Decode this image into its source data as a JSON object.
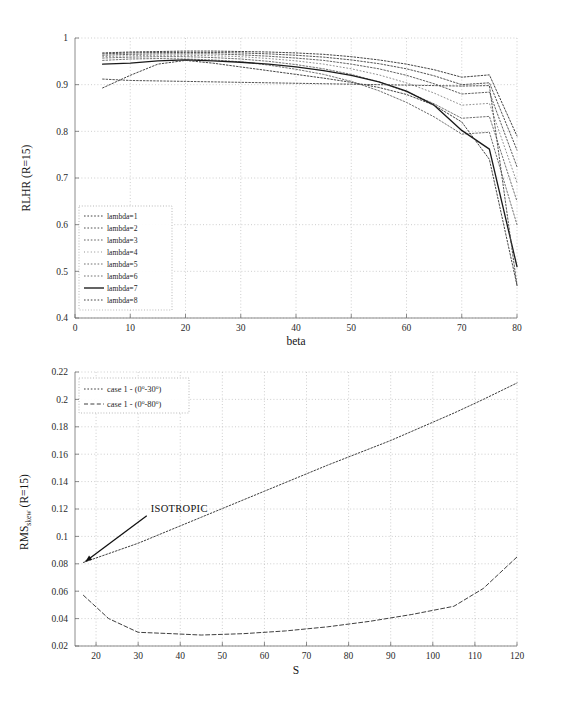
{
  "figure": {
    "title": "",
    "background": "#ffffff"
  },
  "chart_data": [
    {
      "id": "top",
      "type": "line",
      "title": "",
      "xlabel": "beta",
      "ylabel": "RLHR (R=15)",
      "xlim": [
        0,
        80
      ],
      "ylim": [
        0.4,
        1
      ],
      "xticks": [
        0,
        10,
        20,
        30,
        40,
        50,
        60,
        70,
        80
      ],
      "yticks": [
        0.4,
        0.5,
        0.6,
        0.7,
        0.8,
        0.9,
        1
      ],
      "grid": "dotted",
      "legend_position": "lower-left",
      "x": [
        5,
        10,
        15,
        20,
        25,
        30,
        35,
        40,
        45,
        50,
        55,
        60,
        65,
        70,
        75,
        80
      ],
      "series": [
        {
          "name": "lambda=1",
          "style": "dotted",
          "color": "#3a3a3a",
          "values": [
            0.968,
            0.97,
            0.971,
            0.972,
            0.972,
            0.971,
            0.97,
            0.968,
            0.965,
            0.96,
            0.953,
            0.944,
            0.932,
            0.916,
            0.921,
            0.79
          ]
        },
        {
          "name": "lambda=2",
          "style": "dotted",
          "color": "#4a4a4a",
          "values": [
            0.966,
            0.968,
            0.969,
            0.969,
            0.969,
            0.968,
            0.966,
            0.963,
            0.959,
            0.953,
            0.945,
            0.934,
            0.919,
            0.9,
            0.904,
            0.76
          ]
        },
        {
          "name": "lambda=3",
          "style": "dotted",
          "color": "#5a5a5a",
          "values": [
            0.963,
            0.965,
            0.966,
            0.966,
            0.966,
            0.964,
            0.961,
            0.957,
            0.952,
            0.944,
            0.934,
            0.92,
            0.902,
            0.88,
            0.884,
            0.724
          ]
        },
        {
          "name": "lambda=4",
          "style": "dotted-light",
          "color": "#8a8a8a",
          "values": [
            0.96,
            0.962,
            0.963,
            0.963,
            0.962,
            0.96,
            0.956,
            0.951,
            0.944,
            0.934,
            0.921,
            0.904,
            0.882,
            0.856,
            0.86,
            0.69
          ]
        },
        {
          "name": "lambda=5",
          "style": "dotted",
          "color": "#6a6a6a",
          "values": [
            0.957,
            0.959,
            0.96,
            0.96,
            0.958,
            0.955,
            0.95,
            0.943,
            0.934,
            0.922,
            0.906,
            0.885,
            0.859,
            0.828,
            0.832,
            0.65
          ]
        },
        {
          "name": "lambda=6",
          "style": "dotted",
          "color": "#6a6a6a",
          "values": [
            0.952,
            0.955,
            0.956,
            0.955,
            0.953,
            0.949,
            0.942,
            0.933,
            0.922,
            0.907,
            0.887,
            0.862,
            0.831,
            0.794,
            0.798,
            0.6
          ]
        },
        {
          "name": "lambda=7",
          "style": "solid",
          "color": "#1a1a1a",
          "values": [
            0.944,
            0.946,
            0.951,
            0.953,
            0.951,
            0.948,
            0.944,
            0.938,
            0.93,
            0.92,
            0.906,
            0.886,
            0.856,
            0.802,
            0.762,
            0.51
          ]
        },
        {
          "name": "lambda=8",
          "style": "dotted",
          "color": "#3a3a3a",
          "values": [
            0.893,
            0.92,
            0.944,
            0.952,
            0.946,
            0.938,
            0.93,
            0.922,
            0.914,
            0.905,
            0.894,
            0.879,
            0.856,
            0.82,
            0.74,
            0.47
          ]
        },
        {
          "name": "lower-branch",
          "style": "dotted",
          "color": "#4a4a4a",
          "hidden_from_legend": true,
          "values": [
            0.912,
            0.909,
            0.908,
            0.907,
            0.906,
            0.905,
            0.904,
            0.903,
            0.902,
            0.901,
            0.9,
            0.899,
            0.898,
            0.897,
            0.898,
            0.47
          ]
        }
      ]
    },
    {
      "id": "bottom",
      "type": "line",
      "title": "",
      "xlabel": "S",
      "ylabel": "RMS_skew (R=15)",
      "ylabel_main": "RMS",
      "ylabel_sub": "skew",
      "ylabel_tail": " (R=15)",
      "xlim": [
        15,
        120
      ],
      "ylim": [
        0.02,
        0.22
      ],
      "xticks": [
        20,
        30,
        40,
        50,
        60,
        70,
        80,
        90,
        100,
        110,
        120
      ],
      "yticks": [
        0.02,
        0.04,
        0.06,
        0.08,
        0.1,
        0.12,
        0.14,
        0.16,
        0.18,
        0.2,
        0.22
      ],
      "ytick_labels": [
        "0.02",
        "0.04",
        "0.06",
        "0.08",
        "0.1",
        "0.12",
        "0.14",
        "0.16",
        "0.18",
        "0.2",
        "0.22"
      ],
      "grid": "dotted",
      "legend_position": "upper-left",
      "annotations": [
        {
          "text": "ISOTROPIC",
          "x": 33,
          "y": 0.118,
          "arrow_to_x": 17,
          "arrow_to_y": 0.081
        }
      ],
      "series": [
        {
          "name": "case 1 - (0°-30°)",
          "legend_main": "case 1 - (0",
          "legend_sup1": "o",
          "legend_mid": "-30",
          "legend_sup2": "o",
          "legend_end": ")",
          "style": "dotted",
          "color": "#3f3f3f",
          "x": [
            17,
            30,
            45,
            60,
            75,
            90,
            105,
            112,
            120
          ],
          "values": [
            0.081,
            0.095,
            0.114,
            0.133,
            0.152,
            0.17,
            0.19,
            0.2,
            0.212
          ]
        },
        {
          "name": "case 1 - (0°-80°)",
          "legend_main": "case 1 - (0",
          "legend_sup1": "o",
          "legend_mid": "-80",
          "legend_sup2": "o",
          "legend_end": ")",
          "style": "dashed",
          "color": "#3f3f3f",
          "x": [
            17,
            23,
            30,
            38,
            45,
            55,
            65,
            75,
            85,
            95,
            105,
            112,
            120
          ],
          "values": [
            0.057,
            0.04,
            0.03,
            0.029,
            0.028,
            0.029,
            0.031,
            0.034,
            0.038,
            0.043,
            0.049,
            0.062,
            0.085
          ]
        }
      ]
    }
  ],
  "top_chart": {
    "ylabel": "RLHR (R=15)",
    "xlabel": "beta",
    "xtick_labels": [
      "0",
      "10",
      "20",
      "30",
      "40",
      "50",
      "60",
      "70",
      "80"
    ],
    "ytick_labels": [
      "0.4",
      "0.5",
      "0.6",
      "0.7",
      "0.8",
      "0.9",
      "1"
    ],
    "legend_items": [
      "lambda=1",
      "lambda=2",
      "lambda=3",
      "lambda=4",
      "lambda=5",
      "lambda=6",
      "lambda=7",
      "lambda=8"
    ]
  },
  "bottom_chart": {
    "xlabel": "S",
    "xtick_labels": [
      "20",
      "30",
      "40",
      "50",
      "60",
      "70",
      "80",
      "90",
      "100",
      "110",
      "120"
    ],
    "ytick_labels": [
      "0.02",
      "0.04",
      "0.06",
      "0.08",
      "0.1",
      "0.12",
      "0.14",
      "0.16",
      "0.18",
      "0.2",
      "0.22"
    ],
    "annotation_label": "ISOTROPIC"
  }
}
